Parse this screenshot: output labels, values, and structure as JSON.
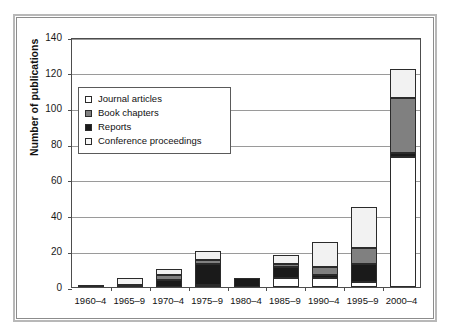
{
  "chart_data": {
    "type": "bar",
    "subtype": "stacked",
    "title": "",
    "xlabel": "",
    "ylabel": "Number of publications",
    "ylim": [
      0,
      140
    ],
    "ytick_step": 20,
    "yticks": [
      "0",
      "20",
      "40",
      "60",
      "80",
      "100",
      "120",
      "140"
    ],
    "grid": true,
    "grid_axis": "y",
    "legend_position": "upper-left-inside",
    "categories": [
      "1960–4",
      "1965–9",
      "1970–4",
      "1975–9",
      "1980–4",
      "1985–9",
      "1990–4",
      "1995–9",
      "2000–4"
    ],
    "series": [
      {
        "name": "Journal articles",
        "color": "#ffffff",
        "values": [
          1,
          1,
          0,
          1,
          0,
          5,
          5,
          3,
          73
        ]
      },
      {
        "name": "Book chapters",
        "color": "#808080",
        "values": [
          0,
          0,
          3,
          2,
          0,
          2,
          4,
          9,
          31
        ]
      },
      {
        "name": "Reports",
        "color": "#1a1a1a",
        "values": [
          0,
          0,
          4,
          12,
          5,
          6,
          2,
          10,
          2
        ]
      },
      {
        "name": "Conference proceedings",
        "color": "#f2f2f2",
        "values": [
          0,
          4,
          3,
          5,
          0,
          5,
          14,
          23,
          16
        ]
      }
    ],
    "stack_order_bottom_to_top": [
      "Journal articles",
      "Reports",
      "Book chapters",
      "Conference proceedings"
    ],
    "totals": [
      1,
      5,
      10,
      20,
      5,
      18,
      25,
      45,
      122
    ]
  },
  "legend": {
    "items": [
      {
        "label": "Journal articles",
        "color": "#ffffff"
      },
      {
        "label": "Book chapters",
        "color": "#808080"
      },
      {
        "label": "Reports",
        "color": "#1a1a1a"
      },
      {
        "label": "Conference proceedings",
        "color": "#f7f7f7"
      }
    ]
  },
  "axes": {
    "y_label": "Number of publications",
    "y_ticks": [
      "140",
      "120",
      "100",
      "80",
      "60",
      "40",
      "20",
      "0"
    ],
    "x_ticks": [
      "1960–4",
      "1965–9",
      "1970–4",
      "1975–9",
      "1980–4",
      "1985–9",
      "1990–4",
      "1995–9",
      "2000–4"
    ]
  },
  "style": {
    "frame_color": "#8c8c8c",
    "grid_color": "#9a9a9a",
    "axis_color": "#4d4d4d",
    "text_color": "#111111",
    "background": "#ffffff"
  }
}
